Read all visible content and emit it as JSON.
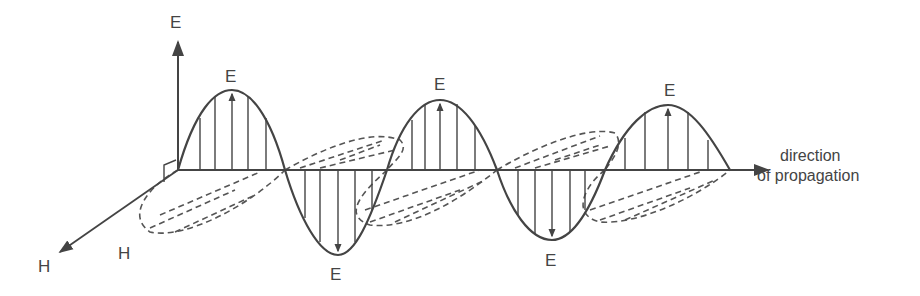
{
  "diagram": {
    "labels": {
      "e_axis": "E",
      "h_axis": "H",
      "h_field": "H",
      "e_peak1": "E",
      "e_peak2": "E",
      "e_peak3": "E",
      "e_trough1": "E",
      "e_trough2": "E",
      "direction_line1": "direction",
      "direction_line2": "of propagation"
    },
    "colors": {
      "stroke": "#444444",
      "background": "#ffffff"
    }
  }
}
